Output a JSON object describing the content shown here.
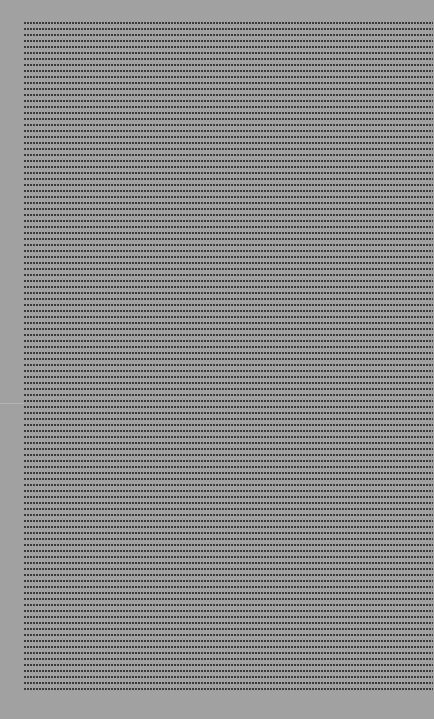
{
  "canvas": {
    "background_color": "#a1a1a1",
    "dot_color": "#3a3a3a",
    "dot_pitch_x": 3,
    "dot_pitch_y": 6
  }
}
